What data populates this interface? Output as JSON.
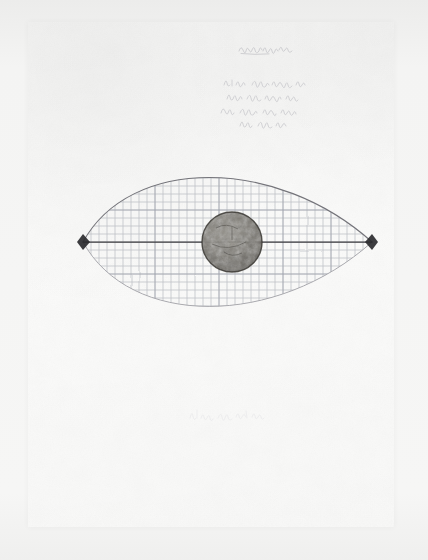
{
  "document": {
    "kind": "scanned pencil drawing on paper",
    "medium": "graphite on off-white paper",
    "page_background": "#fbfbfa",
    "scan_background": "#f3f3f2"
  },
  "annotations": {
    "title_note": "(illegible cursive)",
    "body_note": "(illegible cursive, four lines)",
    "caption_note": "(illegible cursive)"
  },
  "figure": {
    "name": "vesica lens with grid and central disc",
    "description": "Pointed oval (eye / vesica piscis) formed by two symmetric arcs meeting at left and right vertices, filled with a hand-ruled square grid, bisected by a dark horizontal axis, with a dark textured circular disc at the centre.",
    "left_vertex": {
      "x": 83,
      "y": 242,
      "label": "left vertex node"
    },
    "right_vertex": {
      "x": 372,
      "y": 242,
      "label": "right vertex node"
    },
    "axis": {
      "y": 242,
      "x_start": 83,
      "x_end": 372,
      "label": "horizontal axis"
    },
    "disc": {
      "cx": 232,
      "cy": 242,
      "r": 30,
      "label": "central disc"
    },
    "grid": {
      "cell_px": 8,
      "label": "hand ruled grid"
    },
    "span_px": {
      "width": 289,
      "height": 172
    },
    "colors": {
      "arc": "#7e7e82",
      "grid": "#b9bcc2",
      "axis": "#3a3a3e",
      "vertex": "#2b2b2f",
      "disc": "#6d6a63"
    }
  }
}
